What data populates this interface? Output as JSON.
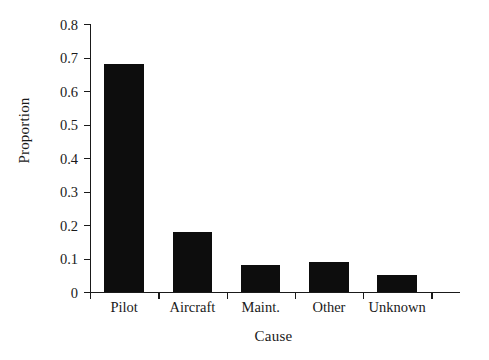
{
  "chart_data": {
    "type": "bar",
    "title": "",
    "xlabel": "Cause",
    "ylabel": "Proportion",
    "categories": [
      "Pilot",
      "Aircraft",
      "Maint.",
      "Other",
      "Unknown"
    ],
    "values": [
      0.68,
      0.18,
      0.08,
      0.09,
      0.05
    ],
    "ylim": [
      0,
      0.8
    ],
    "ytick_labels": [
      "0",
      "0.1",
      "0.2",
      "0.3",
      "0.4",
      "0.5",
      "0.6",
      "0.7",
      "0.8"
    ],
    "ytick_values": [
      0,
      0.1,
      0.2,
      0.3,
      0.4,
      0.5,
      0.6,
      0.7,
      0.8
    ],
    "grid": false,
    "legend": false,
    "bar_color": "#0d0d0d",
    "axis_color": "#1a1a1a",
    "background": "#ffffff"
  }
}
